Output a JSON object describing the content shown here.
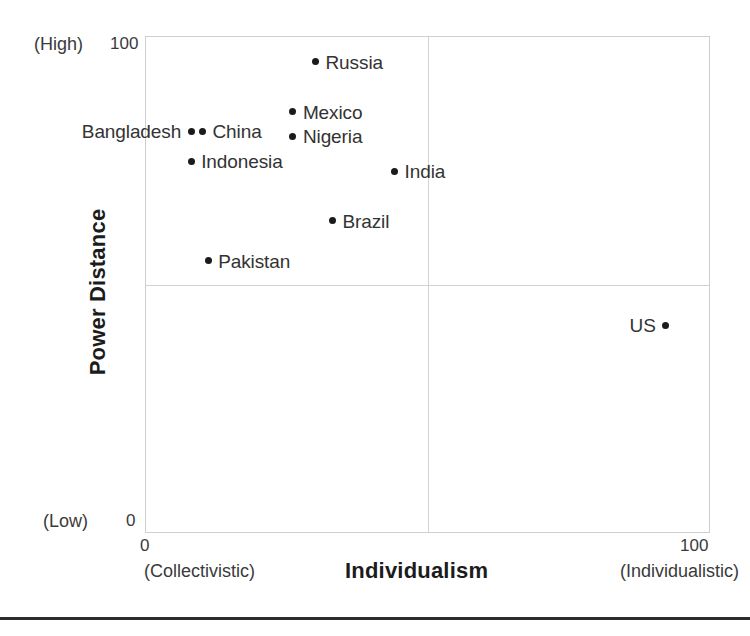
{
  "chart_data": {
    "type": "scatter",
    "title": "",
    "xlabel": "Individualism",
    "ylabel": "Power Distance",
    "xlim": [
      0,
      100
    ],
    "ylim": [
      0,
      100
    ],
    "grid": true,
    "grid_description": "quadrant dividers at x=50 and y=50",
    "legend": "none",
    "x_ticks": [
      "0",
      "100"
    ],
    "y_ticks": [
      "0",
      "100"
    ],
    "x_axis_low_note": "(Collectivistic)",
    "x_axis_high_note": "(Individualistic)",
    "y_axis_low_note": "(Low)",
    "y_axis_high_note": "(High)",
    "points": [
      {
        "label": "Russia",
        "x": 30,
        "y": 95,
        "label_side": "right"
      },
      {
        "label": "Mexico",
        "x": 26,
        "y": 85,
        "label_side": "right"
      },
      {
        "label": "Nigeria",
        "x": 26,
        "y": 80,
        "label_side": "right"
      },
      {
        "label": "Bangladesh",
        "x": 8,
        "y": 81,
        "label_side": "left"
      },
      {
        "label": "China",
        "x": 10,
        "y": 81,
        "label_side": "right"
      },
      {
        "label": "Indonesia",
        "x": 8,
        "y": 75,
        "label_side": "right"
      },
      {
        "label": "India",
        "x": 44,
        "y": 73,
        "label_side": "right"
      },
      {
        "label": "Brazil",
        "x": 33,
        "y": 63,
        "label_side": "right"
      },
      {
        "label": "Pakistan",
        "x": 11,
        "y": 55,
        "label_side": "right"
      },
      {
        "label": "US",
        "x": 92,
        "y": 42,
        "label_side": "left"
      }
    ]
  },
  "axes": {
    "x_title": "Individualism",
    "y_title": "Power Distance",
    "y_high_label": "(High)",
    "y_low_label": "(Low)",
    "y_tick_top": "100",
    "y_tick_bottom": "0",
    "x_tick_left": "0",
    "x_tick_right": "100",
    "x_left_note": "(Collectivistic)",
    "x_right_note": "(Individualistic)"
  },
  "colors": {
    "point": "#1b1b1b",
    "grid": "#d2d2d2",
    "frame": "#cfcfcf",
    "text": "#333333",
    "rule": "#2c2c2c"
  }
}
